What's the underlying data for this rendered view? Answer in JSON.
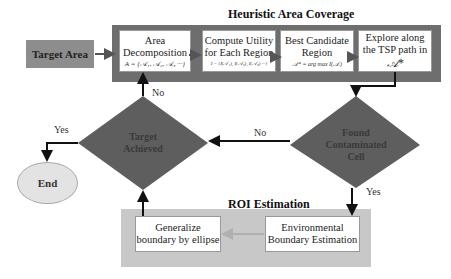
{
  "sections": {
    "heuristic_title": "Heuristic Area Coverage",
    "roi_title": "ROI Estimation"
  },
  "nodes": {
    "target_area": "Target Area",
    "area_decomposition": {
      "line1": "Area",
      "line2": "Decomposition",
      "formula": "A = {𝒜₁, 𝒜₂, 𝒜₃ ···}"
    },
    "compute_utility": {
      "line1": "Compute Utility",
      "line2": "for Each Region",
      "formula": "I = {I(𝒜₁), I(𝒜₂), I(𝒜₃) ···}"
    },
    "best_candidate": {
      "line1": "Best Candidate",
      "line2": "Region",
      "formula": "𝒜* = arg max I(𝒜ᵢ)"
    },
    "explore_tsp": {
      "line1": "Explore along",
      "line2": "the TSP path in",
      "formula": "𝒜*"
    },
    "found_contaminated": {
      "line1": "Found",
      "line2": "Contaminated",
      "line3": "Cell"
    },
    "target_achieved": {
      "line1": "Target",
      "line2": "Achieved"
    },
    "end": "End",
    "environmental_boundary": {
      "line1": "Environmental",
      "line2": "Boundary Estimation"
    },
    "generalize_boundary": {
      "line1": "Generalize",
      "line2": "boundary by ellipse"
    }
  },
  "edge_labels": {
    "achieved_no": "No",
    "achieved_yes": "Yes",
    "found_no": "No",
    "found_yes": "Yes"
  },
  "colors": {
    "dark_panel": "#6e6e6e",
    "light_panel": "#c8c8c8",
    "diamond": "#5e5e5e",
    "target_box": "#8d8d8d",
    "end_ellipse": "#e3e3e3",
    "arrow": "#111111",
    "faint_arrow": "#b0b0b0"
  }
}
